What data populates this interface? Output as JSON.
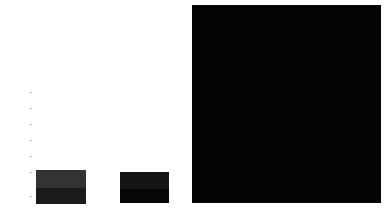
{
  "chart_data": {
    "type": "bar",
    "title": "",
    "subtitle": "",
    "xlabel": "",
    "ylabel": "",
    "grid": false,
    "legend": null,
    "categories": [
      "bar-1",
      "bar-2",
      "bar-3"
    ],
    "values": [
      34,
      31,
      198
    ],
    "ylim": [
      0,
      208
    ],
    "tick_labels": [
      "",
      "",
      "",
      "",
      "",
      "",
      ""
    ],
    "tick_positions": [
      92,
      108,
      124,
      140,
      156,
      172,
      196
    ],
    "bars": [
      {
        "name": "bar-1",
        "value": 34,
        "x": 36,
        "width": 50,
        "top": 170,
        "height": 34,
        "color": "#2f2f2f",
        "segments": [
          {
            "name": "bar-1-upper",
            "offset": 0,
            "height": 18,
            "color": "#333333"
          },
          {
            "name": "bar-1-lower",
            "offset": 18,
            "height": 16,
            "color": "#1b1b1b"
          }
        ]
      },
      {
        "name": "bar-2",
        "value": 31,
        "x": 120,
        "width": 49,
        "top": 172,
        "height": 31,
        "color": "#101010",
        "segments": [
          {
            "name": "bar-2-upper",
            "offset": 0,
            "height": 17,
            "color": "#151515"
          },
          {
            "name": "bar-2-lower",
            "offset": 17,
            "height": 14,
            "color": "#070707"
          }
        ]
      },
      {
        "name": "bar-3",
        "value": 198,
        "x": 192,
        "width": 189,
        "top": 5,
        "height": 198,
        "color": "#050505",
        "segments": [
          {
            "name": "bar-3-body",
            "offset": 0,
            "height": 198,
            "color": "#040404"
          }
        ]
      }
    ],
    "colors": {
      "background": "#ffffff",
      "axis": "#b9b9b9",
      "tick_text": "#9a9a9a",
      "bar_light": "#333333",
      "bar_mid": "#1b1b1b",
      "bar_dark": "#040404"
    }
  }
}
